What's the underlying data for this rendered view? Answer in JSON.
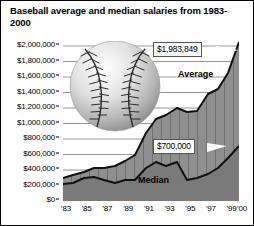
{
  "chart_data": {
    "type": "area",
    "title": "Baseball average and median salaries from 1983-2000",
    "xlabel": "",
    "ylabel": "",
    "ylim": [
      0,
      2000000
    ],
    "grid": true,
    "legend_position": "inline-labels",
    "x": [
      "'83",
      "'84",
      "'85",
      "'86",
      "'87",
      "'88",
      "'89",
      "'90",
      "'91",
      "'92",
      "'93",
      "'94",
      "'95",
      "'96",
      "'97",
      "'98",
      "'99",
      "'00"
    ],
    "ytick_labels": [
      "$2,000,000",
      "$1,800,000",
      "$1,600,000",
      "$1,400,000",
      "$1,200,000",
      "$1,000,000",
      "$800,000",
      "$600,000",
      "$400,000",
      "$200,000",
      "$0"
    ],
    "ytick_values": [
      2000000,
      1800000,
      1600000,
      1400000,
      1200000,
      1000000,
      800000,
      600000,
      400000,
      200000,
      0
    ],
    "xtick_labels": [
      "'83",
      "'85",
      "'87",
      "'89",
      "'91",
      "'93",
      "'95",
      "'97",
      "'99",
      "'00"
    ],
    "series": [
      {
        "name": "Average",
        "values": [
          289000,
          330000,
          371000,
          412000,
          412000,
          438000,
          497000,
          578000,
          851000,
          1028000,
          1076000,
          1168000,
          1110000,
          1120000,
          1336000,
          1398000,
          1611000,
          1983849
        ]
      },
      {
        "name": "Median",
        "values": [
          207000,
          229000,
          297000,
          300000,
          265000,
          230000,
          275000,
          275000,
          425000,
          500000,
          450000,
          500000,
          275000,
          300000,
          350000,
          420000,
          550000,
          700000
        ]
      }
    ],
    "annotations": [
      {
        "name": "average-endpoint",
        "label": "$1,983,849",
        "series": "Average",
        "x": "'00",
        "value": 1983849
      },
      {
        "name": "median-endpoint",
        "label": "$700,000",
        "series": "Median",
        "x": "'00",
        "value": 700000
      }
    ],
    "decoration": {
      "image": "baseball-graphic"
    }
  }
}
